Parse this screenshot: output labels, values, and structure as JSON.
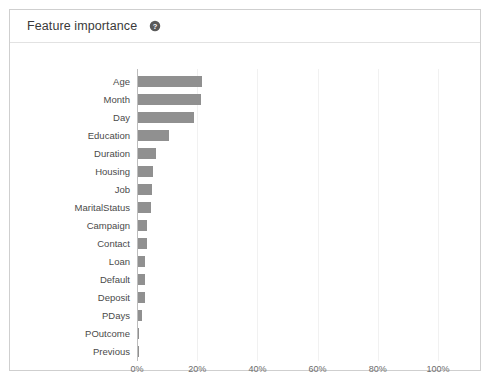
{
  "card": {
    "title": "Feature importance",
    "help_icon": "help-circle-icon",
    "border_color": "#cfcfcf",
    "background": "#ffffff"
  },
  "chart_data": {
    "type": "bar",
    "orientation": "horizontal",
    "title": "Feature importance",
    "xlabel": "",
    "ylabel": "",
    "xlim": [
      0,
      100
    ],
    "xtick_labels": [
      "0%",
      "20%",
      "40%",
      "60%",
      "80%",
      "100%"
    ],
    "xtick_values": [
      0,
      20,
      40,
      60,
      80,
      100
    ],
    "grid": true,
    "grid_axis": "x",
    "legend": false,
    "bar_color": "#909090",
    "units": "percent",
    "categories": [
      "Age",
      "Month",
      "Day",
      "Education",
      "Duration",
      "Housing",
      "Job",
      "MaritalStatus",
      "Campaign",
      "Contact",
      "Loan",
      "Default",
      "Deposit",
      "PDays",
      "POutcome",
      "Previous"
    ],
    "values": [
      21.3,
      21.0,
      18.6,
      10.3,
      6.0,
      5.0,
      4.7,
      4.3,
      3.0,
      3.0,
      2.3,
      2.3,
      2.2,
      1.3,
      0.2,
      0.2
    ]
  }
}
